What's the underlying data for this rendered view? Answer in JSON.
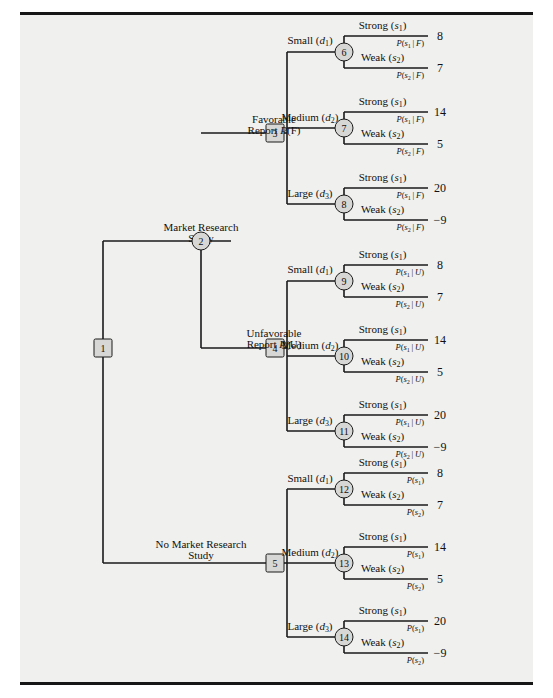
{
  "figure": {
    "background": "#f0f0ee",
    "line_color": "#1a1a1a",
    "node_fill": "#d7d7d5",
    "width": 553,
    "height": 698
  },
  "root": {
    "node_id": "1",
    "type": "decision-square",
    "x": 103,
    "y": 348
  },
  "root_branches": [
    {
      "id": "market-research",
      "label_line1": "Market Research",
      "label_line2": "Study",
      "label_x": 201,
      "label_y": 234,
      "target_node": "2",
      "node_type": "chance-circle",
      "node_x": 201,
      "node_y": 241
    },
    {
      "id": "no-market-research",
      "label_line1": "No Market Research",
      "label_line2": "Study",
      "label_x": 201,
      "label_y": 551,
      "target_node": "5",
      "node_type": "decision-square",
      "node_x": 275,
      "node_y": 563
    }
  ],
  "report_branches": [
    {
      "id": "favorable",
      "label_line1": "Favorable",
      "label_line2_prefix": "Report ",
      "label_line2_prob": "P(F)",
      "label_x": 236,
      "label_y": 126,
      "node_id": "3",
      "node_x": 275,
      "node_y": 133
    },
    {
      "id": "unfavorable",
      "label_line1": "Unfavorable",
      "label_line2_prefix": "Report ",
      "label_line2_prob": "P(U)",
      "label_x": 236,
      "label_y": 340,
      "node_id": "4",
      "node_x": 275,
      "node_y": 348
    }
  ],
  "decision_labels": {
    "small": "Small (d",
    "small_sub": "1",
    "medium": "Medium (d",
    "medium_sub": "2",
    "large": "Large (d",
    "large_sub": "3",
    "close_paren": ")"
  },
  "state_labels": {
    "strong": "Strong (s",
    "strong_sub": "1",
    "weak": "Weak (s",
    "weak_sub": "2",
    "close_paren": ")"
  },
  "chance_nodes": [
    {
      "node_id": "6",
      "node_x": 344,
      "node_y": 52,
      "decision": "Small",
      "decision_sub": "1",
      "decision_label_x": 310,
      "decision_label_y": 42,
      "branch_from": "3",
      "outcomes": [
        {
          "state": "Strong",
          "state_sub": "1",
          "prob": "P(s",
          "prob_sub": "1",
          "prob_cond": "| F)",
          "payoff": "8",
          "y": 36
        },
        {
          "state": "Weak",
          "state_sub": "2",
          "prob": "P(s",
          "prob_sub": "2",
          "prob_cond": "| F)",
          "payoff": "7",
          "y": 68
        }
      ]
    },
    {
      "node_id": "7",
      "node_x": 344,
      "node_y": 128,
      "decision": "Medium",
      "decision_sub": "2",
      "decision_label_x": 310,
      "decision_label_y": 119,
      "branch_from": "3",
      "outcomes": [
        {
          "state": "Strong",
          "state_sub": "1",
          "prob": "P(s",
          "prob_sub": "1",
          "prob_cond": "| F)",
          "payoff": "14",
          "y": 112
        },
        {
          "state": "Weak",
          "state_sub": "2",
          "prob": "P(s",
          "prob_sub": "2",
          "prob_cond": "| F)",
          "payoff": "5",
          "y": 144
        }
      ]
    },
    {
      "node_id": "8",
      "node_x": 344,
      "node_y": 204,
      "decision": "Large",
      "decision_sub": "3",
      "decision_label_x": 310,
      "decision_label_y": 195,
      "branch_from": "3",
      "outcomes": [
        {
          "state": "Strong",
          "state_sub": "1",
          "prob": "P(s",
          "prob_sub": "1",
          "prob_cond": "| F)",
          "payoff": "20",
          "y": 188
        },
        {
          "state": "Weak",
          "state_sub": "2",
          "prob": "P(s",
          "prob_sub": "2",
          "prob_cond": "| F)",
          "payoff": "−9",
          "y": 220
        }
      ]
    },
    {
      "node_id": "9",
      "node_x": 344,
      "node_y": 281,
      "decision": "Small",
      "decision_sub": "1",
      "decision_label_x": 310,
      "decision_label_y": 271,
      "branch_from": "4",
      "outcomes": [
        {
          "state": "Strong",
          "state_sub": "1",
          "prob": "P(s",
          "prob_sub": "1",
          "prob_cond": "| U)",
          "payoff": "8",
          "y": 265
        },
        {
          "state": "Weak",
          "state_sub": "2",
          "prob": "P(s",
          "prob_sub": "2",
          "prob_cond": "| U)",
          "payoff": "7",
          "y": 297
        }
      ]
    },
    {
      "node_id": "10",
      "node_x": 344,
      "node_y": 356,
      "decision": "Medium",
      "decision_sub": "2",
      "decision_label_x": 310,
      "decision_label_y": 347,
      "branch_from": "4",
      "outcomes": [
        {
          "state": "Strong",
          "state_sub": "1",
          "prob": "P(s",
          "prob_sub": "1",
          "prob_cond": "| U)",
          "payoff": "14",
          "y": 340
        },
        {
          "state": "Weak",
          "state_sub": "2",
          "prob": "P(s",
          "prob_sub": "2",
          "prob_cond": "| U)",
          "payoff": "5",
          "y": 372
        }
      ]
    },
    {
      "node_id": "11",
      "node_x": 344,
      "node_y": 431,
      "decision": "Large",
      "decision_sub": "3",
      "decision_label_x": 310,
      "decision_label_y": 422,
      "branch_from": "4",
      "outcomes": [
        {
          "state": "Strong",
          "state_sub": "1",
          "prob": "P(s",
          "prob_sub": "1",
          "prob_cond": "| U)",
          "payoff": "20",
          "y": 415
        },
        {
          "state": "Weak",
          "state_sub": "2",
          "prob": "P(s",
          "prob_sub": "2",
          "prob_cond": "| U)",
          "payoff": "−9",
          "y": 447
        }
      ]
    },
    {
      "node_id": "12",
      "node_x": 344,
      "node_y": 489,
      "decision": "Small",
      "decision_sub": "1",
      "decision_label_x": 310,
      "decision_label_y": 480,
      "branch_from": "5",
      "outcomes": [
        {
          "state": "Strong",
          "state_sub": "1",
          "prob": "P(s",
          "prob_sub": "1",
          "prob_cond": ")",
          "payoff": "8",
          "y": 473
        },
        {
          "state": "Weak",
          "state_sub": "2",
          "prob": "P(s",
          "prob_sub": "2",
          "prob_cond": ")",
          "payoff": "7",
          "y": 505
        }
      ]
    },
    {
      "node_id": "13",
      "node_x": 344,
      "node_y": 563,
      "decision": "Medium",
      "decision_sub": "2",
      "decision_label_x": 310,
      "decision_label_y": 554,
      "branch_from": "5",
      "outcomes": [
        {
          "state": "Strong",
          "state_sub": "1",
          "prob": "P(s",
          "prob_sub": "1",
          "prob_cond": ")",
          "payoff": "14",
          "y": 547
        },
        {
          "state": "Weak",
          "state_sub": "2",
          "prob": "P(s",
          "prob_sub": "2",
          "prob_cond": ")",
          "payoff": "5",
          "y": 579
        }
      ]
    },
    {
      "node_id": "14",
      "node_x": 344,
      "node_y": 637,
      "decision": "Large",
      "decision_sub": "3",
      "decision_label_x": 310,
      "decision_label_y": 628,
      "branch_from": "5",
      "outcomes": [
        {
          "state": "Strong",
          "state_sub": "1",
          "prob": "P(s",
          "prob_sub": "1",
          "prob_cond": ")",
          "payoff": "20",
          "y": 621
        },
        {
          "state": "Weak",
          "state_sub": "2",
          "prob": "P(s",
          "prob_sub": "2",
          "prob_cond": ")",
          "payoff": "−9",
          "y": 653
        }
      ]
    }
  ],
  "geometry": {
    "payoff_x": 440,
    "outcome_line_left": 353,
    "outcome_line_right": 428,
    "spine_decision_x": 287,
    "spine_root_x": 103,
    "spine_report_x": 201
  }
}
